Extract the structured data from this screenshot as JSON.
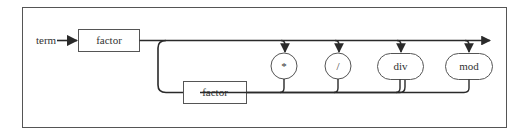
{
  "diagram": {
    "entry_label": "term",
    "nodes": [
      {
        "id": "factor-main",
        "label": "factor",
        "kind": "nonterminal"
      },
      {
        "id": "factor-loop",
        "label": "factor",
        "kind": "nonterminal"
      },
      {
        "id": "op-times",
        "label": "*",
        "kind": "terminal"
      },
      {
        "id": "op-divide",
        "label": "/",
        "kind": "terminal"
      },
      {
        "id": "op-div",
        "label": "div",
        "kind": "terminal"
      },
      {
        "id": "op-mod",
        "label": "mod",
        "kind": "terminal"
      }
    ],
    "colors": {
      "stroke": "#3a3a3a",
      "frame": "#555555",
      "text": "#333333",
      "background": "#ffffff"
    }
  }
}
